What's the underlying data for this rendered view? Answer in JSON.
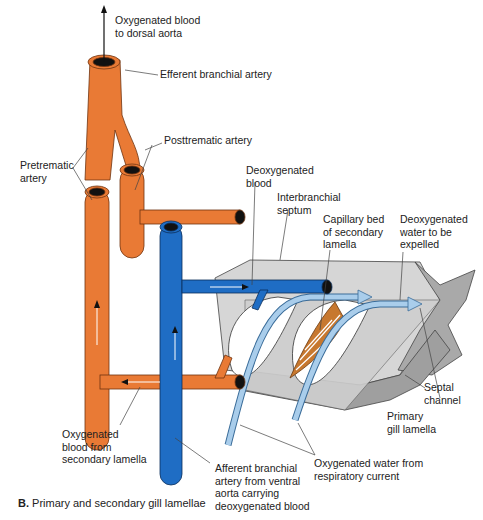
{
  "figure": {
    "caption_letter": "B.",
    "caption_text": "Primary and secondary gill lamellae"
  },
  "colors": {
    "oxygenated_blood": "#E97A35",
    "deoxygenated_blood": "#1F6DC4",
    "water": "#A9CDEB",
    "tissue": "#C8C8C8",
    "capillary": "#C7782F"
  },
  "labels": {
    "oxygenated_to_aorta": "Oxygenated blood\nto dorsal aorta",
    "efferent_branchial": "Efferent branchial artery",
    "posttrematic": "Posttrematic artery",
    "pretrematic": "Pretrematic\nartery",
    "deoxygenated_blood": "Deoxygenated\nblood",
    "interbranchial_septum": "Interbranchial\nseptum",
    "capillary_bed": "Capillary bed\nof secondary\nlamella",
    "deoxygenated_water": "Deoxygenated\nwater to be\nexpelled",
    "septal_channel": "Septal\nchannel",
    "primary_gill_lamella": "Primary\ngill lamella",
    "oxygenated_from_secondary": "Oxygenated\nblood from\nsecondary lamella",
    "afferent_branchial": "Afferent branchial\nartery from ventral\naorta carrying\ndeoxygenated blood",
    "oxygenated_water": "Oxygenated water from\nrespiratory current"
  }
}
